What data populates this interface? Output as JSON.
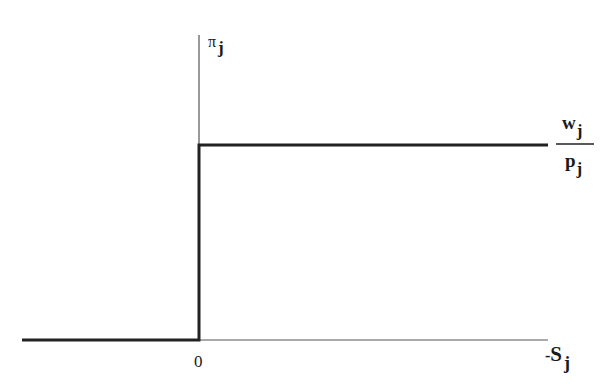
{
  "diagram": {
    "y_axis_label": {
      "symbol": "π",
      "subscript": "j"
    },
    "x_axis_label": {
      "prefix": "-",
      "symbol": "S",
      "subscript": "j"
    },
    "origin_label": "0",
    "level_label": {
      "numerator": {
        "symbol": "w",
        "subscript": "j"
      },
      "denominator": {
        "symbol": "p",
        "subscript": "j"
      }
    },
    "colors": {
      "axis": "#555555",
      "step": "#222222",
      "background": "#ffffff"
    }
  }
}
